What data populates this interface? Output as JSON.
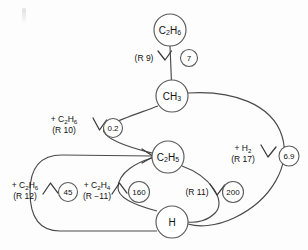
{
  "diagram": {
    "type": "reaction-flux-diagram",
    "title": "",
    "species_nodes": [
      {
        "id": "c2h6-top",
        "label": "C2H6",
        "label_parts": [
          {
            "t": "C"
          },
          {
            "t": "2",
            "sub": true
          },
          {
            "t": "H"
          },
          {
            "t": "6",
            "sub": true
          }
        ],
        "cx": 170,
        "cy": 30,
        "r": 16
      },
      {
        "id": "ch3",
        "label": "CH3",
        "label_parts": [
          {
            "t": "CH"
          },
          {
            "t": "3",
            "sub": true
          }
        ],
        "cx": 172,
        "cy": 96,
        "r": 16
      },
      {
        "id": "c2h5",
        "label": "C2H5",
        "label_parts": [
          {
            "t": "C"
          },
          {
            "t": "2",
            "sub": true
          },
          {
            "t": "H"
          },
          {
            "t": "5",
            "sub": true
          }
        ],
        "cx": 168,
        "cy": 157,
        "r": 16
      },
      {
        "id": "h",
        "label": "H",
        "label_parts": [
          {
            "t": "H"
          }
        ],
        "cx": 172,
        "cy": 222,
        "r": 16
      }
    ],
    "flux_circles": [
      {
        "id": "flux-7",
        "value": "7",
        "cx": 189,
        "cy": 58,
        "r": 8.5
      },
      {
        "id": "flux-02",
        "value": "0.2",
        "cx": 113,
        "cy": 128,
        "r": 9.5
      },
      {
        "id": "flux-69",
        "value": "6.9",
        "cx": 289,
        "cy": 156,
        "r": 10
      },
      {
        "id": "flux-45",
        "value": "45",
        "cx": 68,
        "cy": 192,
        "r": 9.5
      },
      {
        "id": "flux-160",
        "value": "160",
        "cx": 139,
        "cy": 192,
        "r": 10.5
      },
      {
        "id": "flux-200",
        "value": "200",
        "cx": 233,
        "cy": 192,
        "r": 10.5
      }
    ],
    "reaction_labels": [
      {
        "id": "label-r9",
        "lines": [
          {
            "parts": [
              {
                "t": "(R 9)"
              }
            ]
          }
        ],
        "x": 144,
        "y": 61,
        "anchor": "middle"
      },
      {
        "id": "label-r10",
        "lines": [
          {
            "parts": [
              {
                "t": "+ C"
              },
              {
                "t": "2",
                "sub": true
              },
              {
                "t": "H"
              },
              {
                "t": "6",
                "sub": true
              }
            ]
          },
          {
            "parts": [
              {
                "t": "(R 10)"
              }
            ]
          }
        ],
        "x": 64,
        "y": 123,
        "anchor": "middle"
      },
      {
        "id": "label-r17",
        "lines": [
          {
            "parts": [
              {
                "t": "+ H"
              },
              {
                "t": "2",
                "sub": true
              }
            ]
          },
          {
            "parts": [
              {
                "t": "(R 17)"
              }
            ]
          }
        ],
        "x": 243,
        "y": 151,
        "anchor": "middle"
      },
      {
        "id": "label-r12",
        "lines": [
          {
            "parts": [
              {
                "t": "+ C"
              },
              {
                "t": "2",
                "sub": true
              },
              {
                "t": "H"
              },
              {
                "t": "6",
                "sub": true
              }
            ]
          },
          {
            "parts": [
              {
                "t": "(R 12)"
              }
            ]
          }
        ],
        "x": 25,
        "y": 188,
        "anchor": "middle"
      },
      {
        "id": "label-rm11",
        "lines": [
          {
            "parts": [
              {
                "t": "+ C"
              },
              {
                "t": "2",
                "sub": true
              },
              {
                "t": "H"
              },
              {
                "t": "4",
                "sub": true
              }
            ]
          },
          {
            "parts": [
              {
                "t": "(R −11)"
              }
            ]
          }
        ],
        "x": 97,
        "y": 188,
        "anchor": "middle"
      },
      {
        "id": "label-r11",
        "lines": [
          {
            "parts": [
              {
                "t": "(R 11)"
              }
            ]
          }
        ],
        "x": 198,
        "y": 195,
        "anchor": "middle"
      }
    ],
    "edges": [
      {
        "id": "edge-r9",
        "from": "c2h6-top",
        "to": "ch3",
        "reaction": "R 9",
        "flux": "7",
        "path": "M 170 46 L 171.4 80"
      },
      {
        "id": "edge-r10",
        "from": "ch3",
        "to": "c2h5",
        "reaction": "R 10",
        "flux": "0.2",
        "path": "M 157 104 C 116 116, 101 132, 152 152"
      },
      {
        "id": "edge-r17",
        "from": "ch3",
        "to": "h",
        "reaction": "R 17",
        "flux": "6.9",
        "path": "M 188 93 C 246 90, 290 118, 283 162 C 277 200, 230 226, 189 224"
      },
      {
        "id": "edge-r11",
        "from": "c2h5",
        "to": "h",
        "reaction": "R 11",
        "flux": "200",
        "path": "M 182 165 C 216 177, 230 204, 188 221"
      },
      {
        "id": "edge-rm11",
        "from": "h",
        "to": "c2h5",
        "reaction": "R -11",
        "flux": "160",
        "path": "M 157 219 C 116 208, 110 170, 152 158"
      },
      {
        "id": "edge-r12",
        "from": "h",
        "to": "c2h5",
        "reaction": "R 12",
        "flux": "45",
        "path": "M 156 230 L 50 230 C 26 230, 26 154, 50 154 L 153 155"
      }
    ],
    "arrows": [
      {
        "id": "arrow-r9",
        "points": "157.5,52.5 164,60.5 170.5,52.5",
        "for": "edge-r9"
      },
      {
        "id": "arrow-r10",
        "points": "93.5,120.5 99.5,130.5 106,122",
        "for": "edge-r10"
      },
      {
        "id": "arrow-r17",
        "points": "261,146.5 267.5,157 274.5,148.5",
        "for": "edge-r17"
      },
      {
        "id": "arrow-r11",
        "points": "211,185 217.5,195 224.5,186.5",
        "for": "edge-r11"
      },
      {
        "id": "arrow-rm11",
        "points": "112.5,194 120,184 126.5,193.5",
        "for": "edge-rm11"
      },
      {
        "id": "arrow-r12",
        "points": "43.5,194 50.5,184.5 57,193.5",
        "for": "edge-r12"
      },
      {
        "id": "arrow-into-c2h5",
        "points": "143,150 153.5,156.5 143,163",
        "for": "edge-r12"
      }
    ]
  }
}
